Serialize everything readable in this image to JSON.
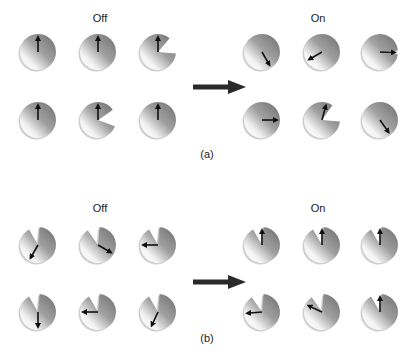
{
  "panels": [
    {
      "id": "a",
      "caption": "(a)",
      "caption_pos": [
        207,
        148
      ],
      "off_label": "Off",
      "on_label": "On",
      "off_label_pos": [
        100,
        12
      ],
      "on_label_pos": [
        318,
        12
      ],
      "big_arrow": {
        "x1": 193,
        "x2": 246,
        "y": 87
      },
      "off": [
        {
          "cx": 38,
          "cy": 52,
          "wedge_start": 130,
          "wedge_size": 0,
          "arrow_angle": 0
        },
        {
          "cx": 98,
          "cy": 52,
          "wedge_start": 150,
          "wedge_size": 0,
          "arrow_angle": 0
        },
        {
          "cx": 158,
          "cy": 52,
          "wedge_start": 40,
          "wedge_size": 55,
          "arrow_angle": 0
        },
        {
          "cx": 38,
          "cy": 120,
          "wedge_start": 130,
          "wedge_size": 0,
          "arrow_angle": 0
        },
        {
          "cx": 98,
          "cy": 120,
          "wedge_start": 55,
          "wedge_size": 55,
          "arrow_angle": 0
        },
        {
          "cx": 158,
          "cy": 120,
          "wedge_start": 130,
          "wedge_size": 0,
          "arrow_angle": 0
        }
      ],
      "on": [
        {
          "cx": 262,
          "cy": 52,
          "wedge_start": 130,
          "wedge_size": 0,
          "arrow_angle": 150
        },
        {
          "cx": 322,
          "cy": 52,
          "wedge_start": 130,
          "wedge_size": 0,
          "arrow_angle": 240
        },
        {
          "cx": 380,
          "cy": 52,
          "wedge_start": 85,
          "wedge_size": 12,
          "arrow_angle": 92
        },
        {
          "cx": 262,
          "cy": 120,
          "wedge_start": 130,
          "wedge_size": 0,
          "arrow_angle": 90
        },
        {
          "cx": 322,
          "cy": 120,
          "wedge_start": 35,
          "wedge_size": 60,
          "arrow_angle": 15
        },
        {
          "cx": 380,
          "cy": 120,
          "wedge_start": 130,
          "wedge_size": 0,
          "arrow_angle": 145
        }
      ]
    },
    {
      "id": "b",
      "caption": "(b)",
      "caption_pos": [
        207,
        332
      ],
      "off_label": "Off",
      "on_label": "On",
      "off_label_pos": [
        100,
        202
      ],
      "on_label_pos": [
        318,
        202
      ],
      "big_arrow": {
        "x1": 193,
        "x2": 246,
        "y": 282
      },
      "off": [
        {
          "cx": 38,
          "cy": 245,
          "wedge_start": 330,
          "wedge_size": 35,
          "arrow_angle": 210
        },
        {
          "cx": 98,
          "cy": 245,
          "wedge_start": 325,
          "wedge_size": 40,
          "arrow_angle": 120
        },
        {
          "cx": 158,
          "cy": 245,
          "wedge_start": 330,
          "wedge_size": 35,
          "arrow_angle": 270
        },
        {
          "cx": 38,
          "cy": 312,
          "wedge_start": 330,
          "wedge_size": 35,
          "arrow_angle": 180
        },
        {
          "cx": 98,
          "cy": 312,
          "wedge_start": 330,
          "wedge_size": 35,
          "arrow_angle": 270
        },
        {
          "cx": 158,
          "cy": 312,
          "wedge_start": 330,
          "wedge_size": 35,
          "arrow_angle": 205
        }
      ],
      "on": [
        {
          "cx": 262,
          "cy": 245,
          "wedge_start": 330,
          "wedge_size": 35,
          "arrow_angle": 0
        },
        {
          "cx": 322,
          "cy": 245,
          "wedge_start": 330,
          "wedge_size": 35,
          "arrow_angle": 0
        },
        {
          "cx": 380,
          "cy": 245,
          "wedge_start": 330,
          "wedge_size": 35,
          "arrow_angle": 0
        },
        {
          "cx": 262,
          "cy": 312,
          "wedge_start": 325,
          "wedge_size": 40,
          "arrow_angle": 265
        },
        {
          "cx": 322,
          "cy": 312,
          "wedge_start": 325,
          "wedge_size": 40,
          "arrow_angle": 295
        },
        {
          "cx": 380,
          "cy": 312,
          "wedge_start": 330,
          "wedge_size": 35,
          "arrow_angle": 0
        }
      ]
    }
  ],
  "style": {
    "disc_radius": 18,
    "dark_shade": "#6e6e6e",
    "light_shade": "#f4f4f4",
    "rim_color": "#a8a8a8",
    "arrow_color": "#111111",
    "big_arrow_color": "#2a2a2a"
  }
}
